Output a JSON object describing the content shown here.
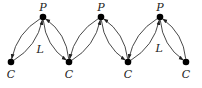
{
  "diagram": {
    "nodes": [
      {
        "id": "c1",
        "label": "C",
        "type": "C"
      },
      {
        "id": "p1",
        "label": "P",
        "type": "P"
      },
      {
        "id": "c2",
        "label": "C",
        "type": "C"
      },
      {
        "id": "p2",
        "label": "P",
        "type": "P"
      },
      {
        "id": "c3",
        "label": "C",
        "type": "C"
      },
      {
        "id": "p3",
        "label": "P",
        "type": "P"
      },
      {
        "id": "c4",
        "label": "C",
        "type": "C"
      }
    ],
    "edges": [
      {
        "from": "c1",
        "to": "p1",
        "label": "L"
      },
      {
        "from": "p1",
        "to": "c1",
        "label": ""
      },
      {
        "from": "p1",
        "to": "c2",
        "label": ""
      },
      {
        "from": "c2",
        "to": "p1",
        "label": ""
      },
      {
        "from": "c2",
        "to": "p2",
        "label": ""
      },
      {
        "from": "p2",
        "to": "c2",
        "label": ""
      },
      {
        "from": "p2",
        "to": "c3",
        "label": ""
      },
      {
        "from": "c3",
        "to": "p2",
        "label": ""
      },
      {
        "from": "c3",
        "to": "p3",
        "label": ""
      },
      {
        "from": "p3",
        "to": "c3",
        "label": ""
      },
      {
        "from": "p3",
        "to": "c4",
        "label": "L"
      },
      {
        "from": "c4",
        "to": "p3",
        "label": ""
      }
    ]
  }
}
